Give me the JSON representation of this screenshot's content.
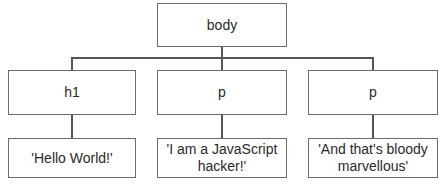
{
  "diagram": {
    "type": "DOM tree",
    "root": {
      "label": "body"
    },
    "elements": [
      {
        "label": "h1",
        "text": "'Hello World!'"
      },
      {
        "label": "p",
        "text": "'I am a JavaScript hacker!'"
      },
      {
        "label": "p",
        "text": "'And that's bloody marvellous'"
      }
    ],
    "colors": {
      "border": "#6b6b6b",
      "connector": "#555555",
      "text": "#2a2a2a",
      "background": "#ffffff"
    }
  }
}
